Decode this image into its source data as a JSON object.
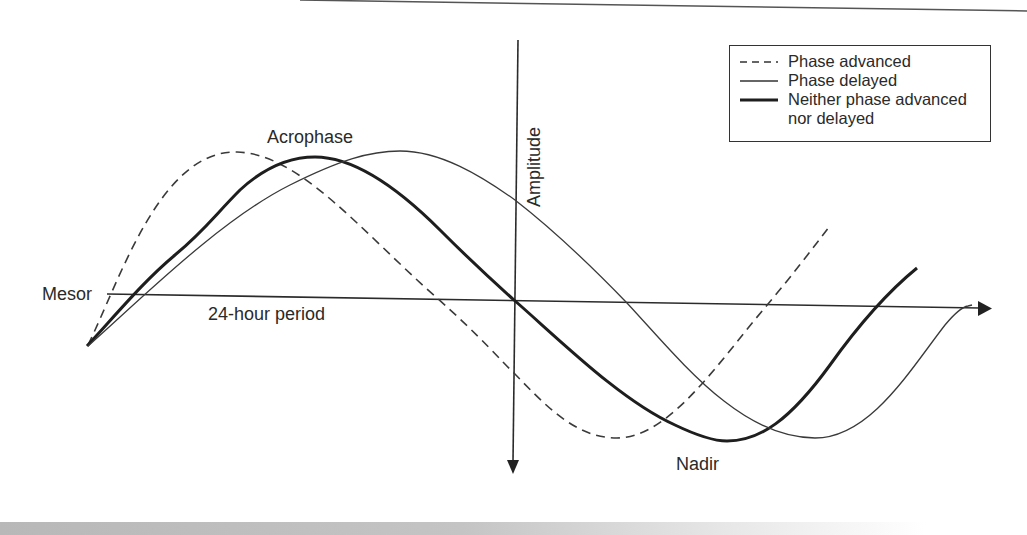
{
  "diagram": {
    "type": "circadian-rhythm-phase-diagram",
    "labels": {
      "acrophase": "Acrophase",
      "mesor": "Mesor",
      "period": "24-hour period",
      "amplitude": "Amplitude",
      "nadir": "Nadir"
    },
    "legend": {
      "items": [
        {
          "style": "dashed",
          "label": "Phase advanced"
        },
        {
          "style": "thin",
          "label": "Phase delayed"
        },
        {
          "style": "thick",
          "label": "Neither phase advanced"
        },
        {
          "style": "none",
          "label": "nor delayed"
        }
      ]
    },
    "colors": {
      "line": "#2b2b2b",
      "background": "#ffffff",
      "band": "#c0c0c0"
    },
    "curves": [
      {
        "name": "Phase advanced",
        "style": "dashed",
        "peak": [
          237,
          152
        ],
        "trough": [
          617,
          438
        ]
      },
      {
        "name": "Neither phase advanced nor delayed",
        "style": "thick",
        "peak": [
          315,
          157
        ],
        "trough": [
          727,
          441
        ]
      },
      {
        "name": "Phase delayed",
        "style": "thin",
        "peak": [
          400,
          151
        ],
        "trough": [
          815,
          438
        ]
      }
    ]
  }
}
